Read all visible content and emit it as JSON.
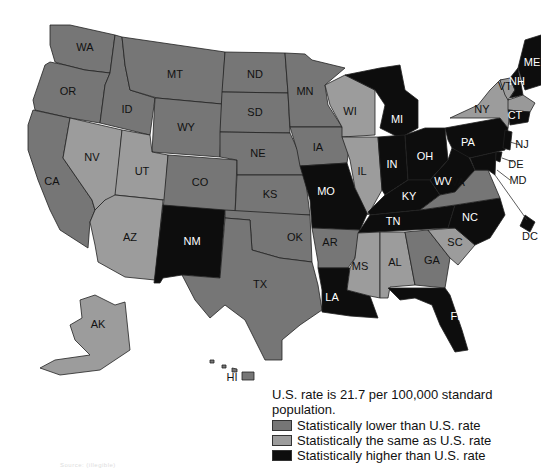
{
  "colors": {
    "lower": "#767676",
    "same": "#9c9c9c",
    "higher": "#0d0d0d",
    "label_dark": "#111111",
    "label_light": "#ffffff"
  },
  "legend": {
    "title": "U.S. rate is 21.7 per 100,000 standard population.",
    "items": [
      {
        "key": "lower",
        "label": "Statistically lower than U.S. rate"
      },
      {
        "key": "same",
        "label": "Statistically the same as U.S. rate"
      },
      {
        "key": "higher",
        "label": "Statistically higher than U.S. rate"
      }
    ]
  },
  "states": [
    {
      "abbr": "WA",
      "cat": "lower"
    },
    {
      "abbr": "OR",
      "cat": "lower"
    },
    {
      "abbr": "CA",
      "cat": "lower"
    },
    {
      "abbr": "ID",
      "cat": "lower"
    },
    {
      "abbr": "NV",
      "cat": "same"
    },
    {
      "abbr": "MT",
      "cat": "lower"
    },
    {
      "abbr": "WY",
      "cat": "lower"
    },
    {
      "abbr": "UT",
      "cat": "same"
    },
    {
      "abbr": "AZ",
      "cat": "same"
    },
    {
      "abbr": "CO",
      "cat": "lower"
    },
    {
      "abbr": "NM",
      "cat": "higher"
    },
    {
      "abbr": "ND",
      "cat": "lower"
    },
    {
      "abbr": "SD",
      "cat": "lower"
    },
    {
      "abbr": "NE",
      "cat": "lower"
    },
    {
      "abbr": "KS",
      "cat": "lower"
    },
    {
      "abbr": "OK",
      "cat": "lower"
    },
    {
      "abbr": "TX",
      "cat": "lower"
    },
    {
      "abbr": "MN",
      "cat": "lower"
    },
    {
      "abbr": "IA",
      "cat": "lower"
    },
    {
      "abbr": "MO",
      "cat": "higher"
    },
    {
      "abbr": "AR",
      "cat": "lower"
    },
    {
      "abbr": "LA",
      "cat": "higher"
    },
    {
      "abbr": "WI",
      "cat": "same"
    },
    {
      "abbr": "IL",
      "cat": "same"
    },
    {
      "abbr": "MI",
      "cat": "higher"
    },
    {
      "abbr": "IN",
      "cat": "higher"
    },
    {
      "abbr": "OH",
      "cat": "higher"
    },
    {
      "abbr": "KY",
      "cat": "higher"
    },
    {
      "abbr": "TN",
      "cat": "higher"
    },
    {
      "abbr": "MS",
      "cat": "same"
    },
    {
      "abbr": "AL",
      "cat": "same"
    },
    {
      "abbr": "GA",
      "cat": "lower"
    },
    {
      "abbr": "FL",
      "cat": "higher"
    },
    {
      "abbr": "SC",
      "cat": "same"
    },
    {
      "abbr": "NC",
      "cat": "higher"
    },
    {
      "abbr": "VA",
      "cat": "lower"
    },
    {
      "abbr": "WV",
      "cat": "higher"
    },
    {
      "abbr": "PA",
      "cat": "higher"
    },
    {
      "abbr": "NY",
      "cat": "same"
    },
    {
      "abbr": "VT",
      "cat": "same"
    },
    {
      "abbr": "NH",
      "cat": "higher"
    },
    {
      "abbr": "ME",
      "cat": "higher"
    },
    {
      "abbr": "CT",
      "cat": "higher"
    },
    {
      "abbr": "NJ",
      "cat": "higher"
    },
    {
      "abbr": "DE",
      "cat": "higher"
    },
    {
      "abbr": "MD",
      "cat": "higher"
    },
    {
      "abbr": "DC",
      "cat": "higher"
    },
    {
      "abbr": "AK",
      "cat": "same"
    },
    {
      "abbr": "HI",
      "cat": "lower"
    }
  ],
  "callout_labels": [
    "NJ",
    "DE",
    "MD",
    "DC"
  ],
  "source_note": "Source: (illegible)"
}
